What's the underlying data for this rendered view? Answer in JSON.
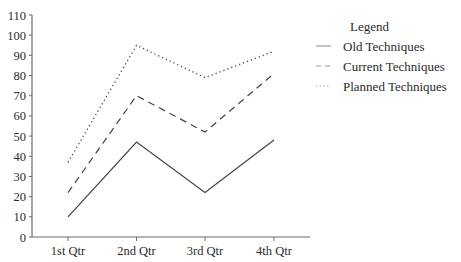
{
  "chart_data": {
    "type": "line",
    "title": "",
    "xlabel": "",
    "ylabel": "",
    "categories": [
      "1st Qtr",
      "2nd Qtr",
      "3rd Qtr",
      "4th Qtr"
    ],
    "series": [
      {
        "name": "Old Techniques",
        "values": [
          10,
          47,
          22,
          48
        ],
        "style": "solid"
      },
      {
        "name": "Current Techniques",
        "values": [
          22,
          70,
          52,
          81
        ],
        "style": "dashed"
      },
      {
        "name": "Planned Techniques",
        "values": [
          37,
          95,
          79,
          92
        ],
        "style": "dotted"
      }
    ],
    "ylim": [
      0,
      110
    ],
    "yticks": [
      0,
      10,
      20,
      30,
      40,
      50,
      60,
      70,
      80,
      90,
      100,
      110
    ],
    "grid": false,
    "legend_position": "right",
    "legend_title": "Legend"
  },
  "colors": {
    "axis": "#6b6b6b",
    "line": "#444444",
    "text": "#2b2b2b"
  }
}
